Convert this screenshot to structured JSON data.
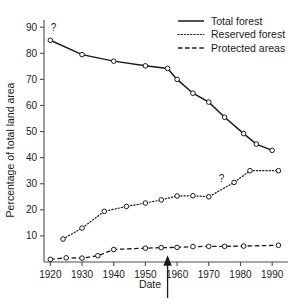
{
  "chart_data": {
    "type": "line",
    "title": "",
    "xlabel": "Date",
    "ylabel": "Percentage of total land area",
    "xlim": [
      1918,
      1995
    ],
    "ylim": [
      0,
      92
    ],
    "xticks": [
      1920,
      1930,
      1940,
      1950,
      1960,
      1970,
      1980,
      1990
    ],
    "yticks": [
      10,
      20,
      30,
      40,
      50,
      60,
      70,
      80,
      90
    ],
    "grid": false,
    "legend_position": "top-right",
    "series": [
      {
        "name": "Total forest",
        "style": "solid",
        "x": [
          1920,
          1930,
          1940,
          1950,
          1957,
          1960,
          1965,
          1970,
          1975,
          1981,
          1985,
          1990
        ],
        "y": [
          85.0,
          79.5,
          77.0,
          75.2,
          74.2,
          70.0,
          64.7,
          61.3,
          55.5,
          49.2,
          45.2,
          42.8
        ]
      },
      {
        "name": "Reserved forest",
        "style": "dotted",
        "x": [
          1924,
          1930,
          1937,
          1944,
          1950,
          1955,
          1960,
          1965,
          1970,
          1978,
          1983,
          1992
        ],
        "y": [
          8.8,
          13.0,
          19.4,
          21.3,
          22.6,
          23.8,
          25.3,
          25.4,
          25.0,
          30.5,
          35.0,
          35.0
        ]
      },
      {
        "name": "Protected areas",
        "style": "dashed",
        "x": [
          1920,
          1925,
          1930,
          1935,
          1940,
          1950,
          1955,
          1960,
          1965,
          1970,
          1975,
          1981,
          1992
        ],
        "y": [
          1.0,
          1.6,
          1.5,
          2.4,
          4.8,
          5.3,
          5.5,
          5.6,
          5.9,
          6.0,
          6.0,
          6.1,
          6.4
        ]
      }
    ],
    "annotations": [
      {
        "text": "?",
        "x": 1921,
        "y": 88.5,
        "series": "Total forest"
      },
      {
        "text": "?",
        "x": 1974,
        "y": 30.8,
        "series": "Reserved forest"
      }
    ],
    "markers": [
      {
        "name": "date-arrow",
        "x": 1957,
        "label": ""
      }
    ],
    "colors": {
      "line": "#1a1a1a",
      "axis": "#4d4d4d",
      "background": "#ffffff",
      "marker_fill": "#ffffff"
    }
  },
  "legend": {
    "items": [
      {
        "label": "Total forest",
        "style": "solid"
      },
      {
        "label": "Reserved forest",
        "style": "dotted"
      },
      {
        "label": "Protected areas",
        "style": "dashed"
      }
    ]
  },
  "axes": {
    "x_title": "Date",
    "y_title": "Percentage of total land area",
    "x_tick_labels": [
      "1920",
      "1930",
      "1940",
      "1950",
      "1960",
      "1970",
      "1980",
      "1990"
    ],
    "y_tick_labels": [
      "10",
      "20",
      "30",
      "40",
      "50",
      "60",
      "70",
      "80",
      "90"
    ]
  }
}
